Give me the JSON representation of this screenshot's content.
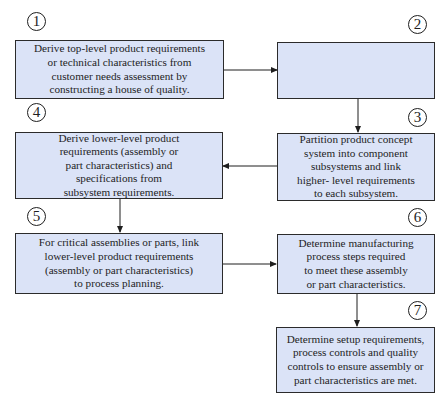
{
  "diagram": {
    "type": "flowchart",
    "steps": [
      {
        "number": "1",
        "text": "Derive top-level product requirements\nor technical characteristics from\ncustomer needs assessment by\nconstructing a house of quality."
      },
      {
        "number": "2",
        "text": "Develop product concepts to\nsatisfy these requirements and\nselect optimum concept."
      },
      {
        "number": "3",
        "text": "Partition product concept\nsystem into component\nsubsystems and link\nhigher- level requirements\nto each subsystem."
      },
      {
        "number": "4",
        "text": "Derive lower-level product\nrequirements (assembly or\npart characteristics) and\nspecifications from\nsubsystem requirements."
      },
      {
        "number": "5",
        "text": "For critical assemblies or parts, link\nlower-level product requirements\n(assembly or part characteristics)\nto process planning."
      },
      {
        "number": "6",
        "text": "Determine manufacturing\nprocess steps required\nto meet these assembly\nor part characteristics."
      },
      {
        "number": "7",
        "text": "Determine setup requirements,\nprocess controls and quality\ncontrols to ensure assembly or\npart characteristics are met."
      }
    ],
    "connections": [
      {
        "from": "1",
        "to": "2",
        "direction": "right"
      },
      {
        "from": "2",
        "to": "3",
        "direction": "down"
      },
      {
        "from": "3",
        "to": "4",
        "direction": "left"
      },
      {
        "from": "4",
        "to": "5",
        "direction": "down"
      },
      {
        "from": "5",
        "to": "6",
        "direction": "right"
      },
      {
        "from": "6",
        "to": "7",
        "direction": "down"
      }
    ],
    "colors": {
      "box_fill": "#dbe3f7",
      "border": "#2b2b2b",
      "text": "#1e1e1e"
    }
  }
}
